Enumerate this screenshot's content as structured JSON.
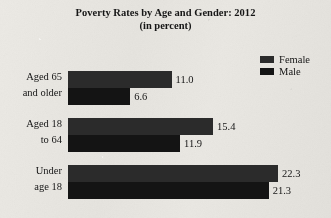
{
  "title": {
    "line1": "Poverty Rates by Age and Gender: 2012",
    "line2": "(in percent)"
  },
  "legend": {
    "position": "top-right",
    "items": [
      {
        "label": "Female",
        "color": "#2b2b2b"
      },
      {
        "label": "Male",
        "color": "#141414"
      }
    ]
  },
  "colors": {
    "background": "#e8e6e1",
    "text": "#161616",
    "female": "#2b2b2b",
    "male": "#141414"
  },
  "chart_data": {
    "type": "bar",
    "orientation": "horizontal",
    "title": "Poverty Rates by Age and Gender: 2012",
    "subtitle": "(in percent)",
    "xlabel": "",
    "ylabel": "",
    "grid": false,
    "legend_position": "top-right",
    "xlim": [
      0,
      23.5
    ],
    "categories": [
      "Aged 65 and older",
      "Aged 18 to 64",
      "Under age 18"
    ],
    "category_lines": [
      {
        "line1": "Aged 65",
        "line2": "and older"
      },
      {
        "line1": "Aged 18",
        "line2": "to 64"
      },
      {
        "line1": "Under",
        "line2": "age 18"
      }
    ],
    "series": [
      {
        "name": "Female",
        "color": "#2b2b2b",
        "values": [
          11.0,
          15.4,
          22.3
        ]
      },
      {
        "name": "Male",
        "color": "#141414",
        "values": [
          6.6,
          11.9,
          21.3
        ]
      }
    ],
    "value_labels": [
      {
        "female": "11.0",
        "male": "6.6"
      },
      {
        "female": "15.4",
        "male": "11.9"
      },
      {
        "female": "22.3",
        "male": "21.3"
      }
    ]
  }
}
